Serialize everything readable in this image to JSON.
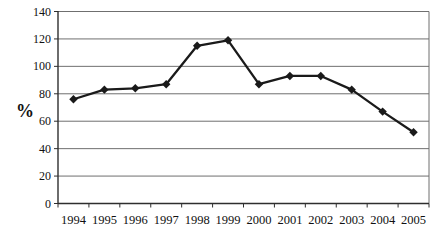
{
  "chart_data": {
    "type": "line",
    "title": "",
    "xlabel": "",
    "ylabel": "%",
    "categories": [
      "1994",
      "1995",
      "1996",
      "1997",
      "1998",
      "1999",
      "2000",
      "2001",
      "2002",
      "2003",
      "2004",
      "2005"
    ],
    "series": [
      {
        "name": "percent",
        "values": [
          76,
          83,
          84,
          87,
          115,
          119,
          87,
          93,
          93,
          83,
          67,
          52
        ]
      }
    ],
    "ylim": [
      0,
      140
    ],
    "yticks": [
      0,
      20,
      40,
      60,
      80,
      100,
      120,
      140
    ],
    "grid": "horizontal",
    "legend": "none",
    "marker": "diamond",
    "colors": {
      "line": "#1a1a1a",
      "marker": "#1a1a1a",
      "grid": "#6f6f6f",
      "axis": "#2e2e2e",
      "tick_label": "#111111",
      "background": "#ffffff"
    }
  }
}
